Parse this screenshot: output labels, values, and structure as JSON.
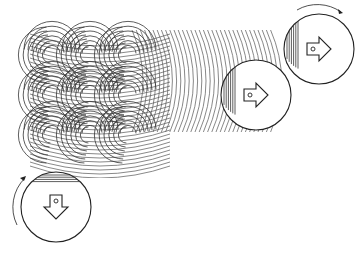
{
  "diagram": {
    "title": "Rotating scanning heads producing overlapping arc track patterns",
    "background": "#ffffff",
    "stroke_color": "#222222",
    "pattern": {
      "horizontal_scan_arcs": {
        "count": 34,
        "x_start": 142,
        "x_step": 4.2,
        "y_top": 30,
        "y_bottom": 132,
        "direction": "convex-right"
      },
      "vertical_scan_arcs": {
        "count": 34,
        "y_start": 44,
        "y_step": 4.0,
        "x_left": 30,
        "x_right": 170,
        "direction": "convex-down"
      },
      "crosshatch_region": {
        "x": 30,
        "y": 30,
        "width": 120,
        "height": 140
      }
    },
    "heads": [
      {
        "id": "head-top-right",
        "cx": 319,
        "cy": 49,
        "r": 35,
        "arrow": "right",
        "rotation_indicator": "clockwise-top"
      },
      {
        "id": "head-middle",
        "cx": 256,
        "cy": 95,
        "r": 35,
        "arrow": "right",
        "rotation_indicator": "none"
      },
      {
        "id": "head-bottom-left",
        "cx": 56,
        "cy": 207,
        "r": 35,
        "arrow": "down",
        "rotation_indicator": "left-side-upward"
      }
    ]
  }
}
